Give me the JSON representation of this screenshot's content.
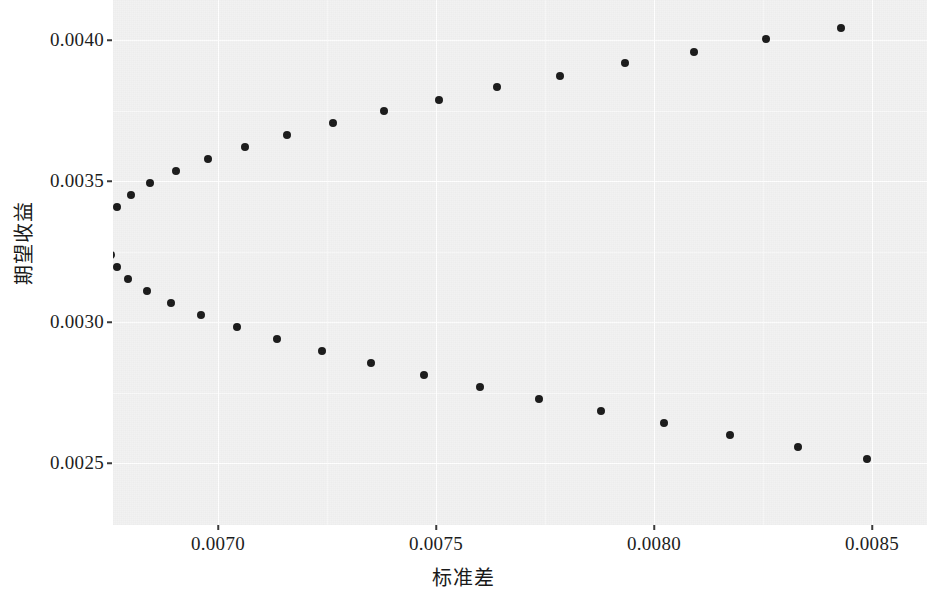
{
  "chart_data": {
    "type": "scatter",
    "title": "",
    "subtitle": "",
    "xlabel": "标准差",
    "ylabel": "期望收益",
    "xlim": [
      0.006745,
      0.008611
    ],
    "ylim": [
      0.002315,
      0.004057
    ],
    "grid": true,
    "legend": null,
    "legend_position": "none",
    "xticks": [
      0.007,
      0.0075,
      0.008,
      0.0085
    ],
    "xtick_labels": [
      "0.0070",
      "0.0075",
      "0.0080",
      "0.0085"
    ],
    "yticks": [
      0.0025,
      0.003,
      0.0035,
      0.004
    ],
    "ytick_labels": [
      "0.0025",
      "0.0030",
      "0.0035",
      "0.0040"
    ],
    "point_color": "#1a1a1a",
    "panel_color": "#f2f2f2",
    "gridline_color": "#ffffff",
    "marker": "circle",
    "marker_size_px": 8,
    "n_points": 50,
    "annotations": [],
    "series": [
      {
        "name": "有效前沿",
        "points": [
          [
            0.008428,
            0.004044
          ],
          [
            0.008257,
            0.004002
          ],
          [
            0.008092,
            0.003959
          ],
          [
            0.007934,
            0.003917
          ],
          [
            0.007784,
            0.003874
          ],
          [
            0.007641,
            0.003832
          ],
          [
            0.007507,
            0.003789
          ],
          [
            0.007381,
            0.003747
          ],
          [
            0.007264,
            0.003704
          ],
          [
            0.007158,
            0.003662
          ],
          [
            0.007062,
            0.003619
          ],
          [
            0.006977,
            0.003577
          ],
          [
            0.006904,
            0.003534
          ],
          [
            0.006845,
            0.003492
          ],
          [
            0.0068,
            0.003449
          ],
          [
            0.006768,
            0.003407
          ],
          [
            0.006751,
            0.003364
          ],
          [
            0.006745,
            0.003322
          ],
          [
            0.006748,
            0.003279
          ],
          [
            0.006755,
            0.003237
          ],
          [
            0.006768,
            0.003194
          ],
          [
            0.006794,
            0.003152
          ],
          [
            0.006837,
            0.003109
          ],
          [
            0.006893,
            0.003067
          ],
          [
            0.006962,
            0.003024
          ],
          [
            0.007043,
            0.002982
          ],
          [
            0.007135,
            0.002939
          ],
          [
            0.007239,
            0.002897
          ],
          [
            0.007352,
            0.002854
          ],
          [
            0.007473,
            0.002812
          ],
          [
            0.007602,
            0.002769
          ],
          [
            0.007737,
            0.002727
          ],
          [
            0.007878,
            0.002684
          ],
          [
            0.008024,
            0.002642
          ],
          [
            0.008175,
            0.002599
          ],
          [
            0.00833,
            0.002557
          ],
          [
            0.008488,
            0.002514
          ],
          [
            0.008649,
            0.002472
          ]
        ]
      }
    ]
  },
  "axes": {
    "x": {
      "title": "标准差",
      "ticks": [
        {
          "label": "0.0070",
          "px": 218
        },
        {
          "label": "0.0075",
          "px": 436
        },
        {
          "label": "0.0080",
          "px": 654
        },
        {
          "label": "0.0085",
          "px": 872
        }
      ]
    },
    "y": {
      "title": "期望收益",
      "ticks": [
        {
          "label": "0.0040",
          "px": 40
        },
        {
          "label": "0.0035",
          "px": 181
        },
        {
          "label": "0.0030",
          "px": 322
        },
        {
          "label": "0.0025",
          "px": 463
        }
      ]
    }
  }
}
